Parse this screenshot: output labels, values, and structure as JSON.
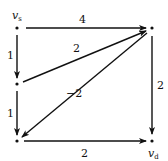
{
  "diagram": {
    "type": "directed-weighted-graph",
    "nodes": [
      {
        "id": "vs",
        "label": "v",
        "sub": "s",
        "x": 17,
        "y": 28
      },
      {
        "id": "tr",
        "label": "",
        "x": 152,
        "y": 28
      },
      {
        "id": "ml",
        "label": "",
        "x": 17,
        "y": 84
      },
      {
        "id": "bl",
        "label": "",
        "x": 17,
        "y": 141
      },
      {
        "id": "vd",
        "label": "v",
        "sub": "d",
        "x": 152,
        "y": 141
      }
    ],
    "edges": [
      {
        "from": "vs",
        "to": "tr",
        "weight": "4"
      },
      {
        "from": "vs",
        "to": "ml",
        "weight": "1"
      },
      {
        "from": "ml",
        "to": "tr",
        "weight": "2"
      },
      {
        "from": "ml",
        "to": "bl",
        "weight": "1"
      },
      {
        "from": "tr",
        "to": "bl",
        "weight": "−2"
      },
      {
        "from": "tr",
        "to": "vd",
        "weight": "2"
      },
      {
        "from": "bl",
        "to": "vd",
        "weight": "2"
      }
    ]
  }
}
